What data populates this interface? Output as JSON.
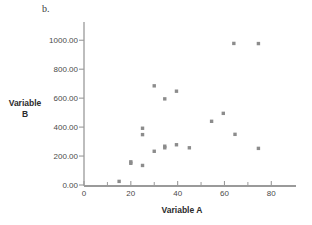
{
  "chart_data": {
    "type": "scatter",
    "title": "b.",
    "xlabel": "Variable A",
    "ylabel": "Variable B",
    "ylabel_lines": [
      "Variable",
      "B"
    ],
    "xlim": [
      0,
      85
    ],
    "ylim": [
      0,
      1050
    ],
    "grid": false,
    "legend": null,
    "x_ticks": [
      0,
      20,
      40,
      60,
      80
    ],
    "x_tick_labels": [
      "0",
      "20",
      "40",
      "60",
      "80"
    ],
    "x_minor_ticks": [
      10,
      30,
      50,
      70
    ],
    "y_ticks": [
      0,
      200,
      400,
      600,
      800,
      1000
    ],
    "y_tick_labels": [
      "0.00",
      "200.00",
      "400.00",
      "600.00",
      "800.00",
      "1000.00"
    ],
    "marker": {
      "shape": "square",
      "color": "#8c8c8c",
      "size": 3.4
    },
    "points": [
      {
        "x": 15.0,
        "y": 25
      },
      {
        "x": 20.0,
        "y": 160
      },
      {
        "x": 20.0,
        "y": 150
      },
      {
        "x": 25.0,
        "y": 135
      },
      {
        "x": 25.0,
        "y": 392
      },
      {
        "x": 25.0,
        "y": 348
      },
      {
        "x": 30.0,
        "y": 233
      },
      {
        "x": 30.0,
        "y": 685
      },
      {
        "x": 34.5,
        "y": 595
      },
      {
        "x": 34.5,
        "y": 268
      },
      {
        "x": 34.5,
        "y": 257
      },
      {
        "x": 39.5,
        "y": 648
      },
      {
        "x": 39.5,
        "y": 278
      },
      {
        "x": 45.0,
        "y": 257
      },
      {
        "x": 54.5,
        "y": 440
      },
      {
        "x": 59.5,
        "y": 495
      },
      {
        "x": 64.0,
        "y": 978
      },
      {
        "x": 64.5,
        "y": 350
      },
      {
        "x": 74.5,
        "y": 977
      },
      {
        "x": 74.5,
        "y": 253
      }
    ]
  },
  "axes": {
    "axis_color": "#9a9a9a",
    "tick_color": "#9a9a9a",
    "text_color": "#4a4a4a"
  }
}
